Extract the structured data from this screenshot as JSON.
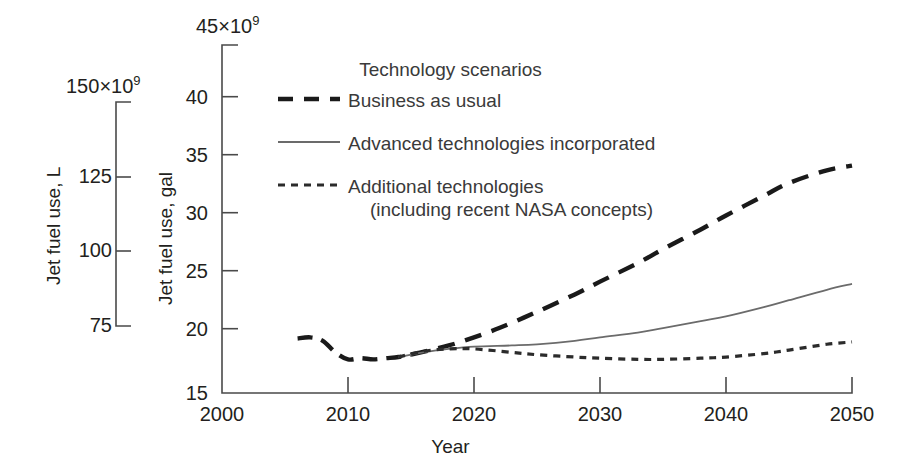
{
  "chart_data": {
    "type": "line",
    "title": "",
    "xlabel": "Year",
    "ylabel": "Jet fuel use, gal",
    "secondary_ylabel": "Jet fuel use, L",
    "xlim": [
      2000,
      2050
    ],
    "ylim": [
      15,
      45
    ],
    "secondary_ylim": [
      68.1,
      170.3
    ],
    "y_axis_multiplier": "×10⁹",
    "secondary_y_axis_multiplier": "×10⁹",
    "grid": false,
    "legend_position": "upper-center",
    "legend_title": "Technology scenarios",
    "xticks": [
      2000,
      2010,
      2020,
      2030,
      2040,
      2050
    ],
    "xtick_labels": [
      "2000",
      "2010",
      "2020",
      "2030",
      "2040",
      "2050"
    ],
    "yticks": [
      15,
      20,
      25,
      30,
      35,
      40,
      45
    ],
    "ytick_labels": [
      "15",
      "20",
      "25",
      "30",
      "35",
      "40",
      "45"
    ],
    "ytop_label_value": "45",
    "secondary_yticks": [
      75,
      100,
      125,
      150
    ],
    "secondary_ytick_labels": [
      "75",
      "100",
      "125",
      "150"
    ],
    "secondary_ytop_label_value": "150",
    "series": [
      {
        "name": "Historical",
        "style": "dashed-thick",
        "in_legend": false,
        "x": [
          2006,
          2007,
          2008,
          2009,
          2010,
          2011,
          2012,
          2013,
          2014,
          2015
        ],
        "values": [
          19.7,
          19.8,
          19.5,
          18.5,
          17.9,
          18.0,
          17.9,
          18.0,
          18.1,
          18.3
        ]
      },
      {
        "name": "Business as usual",
        "style": "dashed-thick",
        "in_legend": true,
        "x": [
          2015,
          2018,
          2020,
          2022,
          2025,
          2028,
          2030,
          2033,
          2035,
          2038,
          2040,
          2043,
          2045,
          2048,
          2050
        ],
        "values": [
          18.3,
          19.1,
          19.8,
          20.6,
          22.0,
          23.5,
          24.6,
          26.2,
          27.4,
          29.1,
          30.3,
          32.0,
          33.1,
          34.2,
          34.6
        ]
      },
      {
        "name": "Advanced technologies incorporated",
        "style": "solid-thin",
        "in_legend": true,
        "x": [
          2014,
          2016,
          2018,
          2020,
          2023,
          2025,
          2028,
          2030,
          2033,
          2035,
          2038,
          2040,
          2043,
          2045,
          2048,
          2050
        ],
        "values": [
          18.1,
          18.5,
          18.8,
          19.0,
          19.1,
          19.2,
          19.5,
          19.8,
          20.2,
          20.6,
          21.2,
          21.6,
          22.4,
          23.0,
          23.9,
          24.4
        ]
      },
      {
        "name": "Additional technologies (including recent NASA concepts)",
        "style": "dotted",
        "in_legend": true,
        "x": [
          2014,
          2016,
          2018,
          2020,
          2023,
          2025,
          2028,
          2030,
          2033,
          2035,
          2038,
          2040,
          2043,
          2045,
          2048,
          2050
        ],
        "values": [
          18.1,
          18.6,
          18.8,
          18.8,
          18.5,
          18.3,
          18.1,
          18.0,
          17.9,
          17.9,
          18.0,
          18.1,
          18.4,
          18.7,
          19.2,
          19.4
        ]
      }
    ]
  },
  "legend": {
    "title": "Technology scenarios",
    "entries": [
      {
        "label": "Business as usual",
        "label2": "",
        "style": "dashed-thick"
      },
      {
        "label": "Advanced technologies incorporated",
        "label2": "",
        "style": "solid-thin"
      },
      {
        "label": "Additional technologies",
        "label2": "(including recent NASA concepts)",
        "style": "dotted"
      }
    ]
  },
  "axes": {
    "primary": {
      "title": "Jet fuel use, gal",
      "top_label": "45",
      "top_exp": "×10",
      "top_sup": "9",
      "ticks": [
        "40",
        "35",
        "30",
        "25",
        "20",
        "15"
      ]
    },
    "secondary": {
      "title": "Jet fuel use, L",
      "top_label": "150",
      "top_exp": "×10",
      "top_sup": "9",
      "ticks": [
        "125",
        "100",
        "75"
      ]
    },
    "x": {
      "title": "Year",
      "ticks": [
        "2000",
        "2010",
        "2020",
        "2030",
        "2040",
        "2050"
      ]
    }
  }
}
